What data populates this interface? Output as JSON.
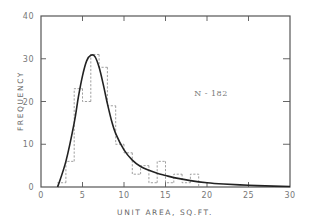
{
  "chart_data": {
    "type": "bar",
    "subtype": "histogram-with-fitted-curve",
    "title": "",
    "xlabel": "UNIT AREA, SQ.FT.",
    "ylabel": "FREQUENCY",
    "xlim": [
      0,
      30
    ],
    "ylim": [
      0,
      40
    ],
    "xticks": [
      0,
      5,
      10,
      15,
      20,
      25,
      30
    ],
    "yticks": [
      0,
      10,
      20,
      30,
      40
    ],
    "grid": false,
    "legend": null,
    "annotation": "N - 182",
    "bin_width": 1,
    "histogram": {
      "name": "Observed frequency",
      "style": "dashed",
      "bins": [
        {
          "x0": 2,
          "x1": 3,
          "value": 1
        },
        {
          "x0": 3,
          "x1": 4,
          "value": 6
        },
        {
          "x0": 4,
          "x1": 5,
          "value": 23
        },
        {
          "x0": 5,
          "x1": 6,
          "value": 20
        },
        {
          "x0": 6,
          "x1": 7,
          "value": 31
        },
        {
          "x0": 7,
          "x1": 8,
          "value": 28
        },
        {
          "x0": 8,
          "x1": 9,
          "value": 19
        },
        {
          "x0": 9,
          "x1": 10,
          "value": 10
        },
        {
          "x0": 10,
          "x1": 11,
          "value": 8
        },
        {
          "x0": 11,
          "x1": 12,
          "value": 3
        },
        {
          "x0": 12,
          "x1": 13,
          "value": 5
        },
        {
          "x0": 13,
          "x1": 14,
          "value": 1
        },
        {
          "x0": 14,
          "x1": 15,
          "value": 6
        },
        {
          "x0": 15,
          "x1": 16,
          "value": 1
        },
        {
          "x0": 16,
          "x1": 17,
          "value": 3
        },
        {
          "x0": 17,
          "x1": 18,
          "value": 1
        },
        {
          "x0": 18,
          "x1": 19,
          "value": 3
        }
      ]
    },
    "curve": {
      "name": "Fitted distribution",
      "style": "solid",
      "x": [
        2.0,
        3.0,
        4.0,
        4.5,
        5.0,
        5.5,
        6.0,
        6.5,
        7.0,
        7.5,
        8.0,
        8.5,
        9.0,
        10.0,
        11.0,
        12.0,
        13.0,
        14.0,
        15.0,
        16.0,
        18.0,
        20.0,
        22.0,
        25.0,
        28.0,
        30.0
      ],
      "y": [
        0,
        6,
        15,
        21,
        26,
        29.5,
        30.8,
        30.5,
        28,
        24,
        19.5,
        15.5,
        12.5,
        8.7,
        6.3,
        4.8,
        3.9,
        3.2,
        2.7,
        2.2,
        1.5,
        1.0,
        0.7,
        0.4,
        0.2,
        0.1
      ]
    }
  },
  "axes": {
    "x_tick_labels": [
      "0",
      "5",
      "10",
      "15",
      "20",
      "25",
      "30"
    ],
    "y_tick_labels": [
      "0",
      "10",
      "20",
      "30",
      "40"
    ],
    "xlabel": "UNIT AREA, SQ.FT.",
    "ylabel": "FREQUENCY"
  },
  "annotation": {
    "text": "N - 182"
  },
  "style": {
    "axis_color": "#555555",
    "curve_color": "#222222",
    "histogram_color": "#888888",
    "label_color": "#777777"
  }
}
